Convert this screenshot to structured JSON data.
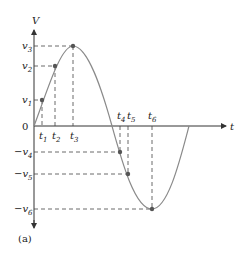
{
  "figure": {
    "caption": "(a)",
    "y_axis_label": "V",
    "x_axis_label": "t",
    "origin_label": "0",
    "colors": {
      "curve": "#8a8a8a",
      "axes": "#333333",
      "dashes": "#444444",
      "points": "#555555"
    }
  },
  "points": [
    {
      "id": "1",
      "v_label": "v",
      "v_sub": "1",
      "v_sign": "",
      "t_label": "t",
      "t_sub": "1"
    },
    {
      "id": "2",
      "v_label": "v",
      "v_sub": "2",
      "v_sign": "",
      "t_label": "t",
      "t_sub": "2"
    },
    {
      "id": "3",
      "v_label": "v",
      "v_sub": "3",
      "v_sign": "",
      "t_label": "t",
      "t_sub": "3"
    },
    {
      "id": "4",
      "v_label": "v",
      "v_sub": "4",
      "v_sign": "−",
      "t_label": "t",
      "t_sub": "4"
    },
    {
      "id": "5",
      "v_label": "v",
      "v_sub": "5",
      "v_sign": "−",
      "t_label": "t",
      "t_sub": "5"
    },
    {
      "id": "6",
      "v_label": "v",
      "v_sub": "6",
      "v_sign": "−",
      "t_label": "t",
      "t_sub": "6"
    }
  ]
}
